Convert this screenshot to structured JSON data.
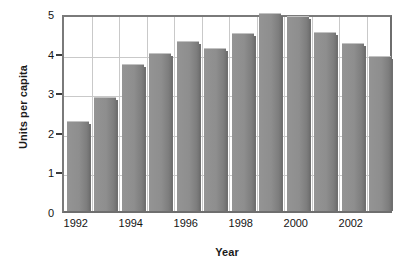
{
  "chart_data": {
    "type": "bar",
    "title": "",
    "xlabel": "Year",
    "ylabel": "Units per capita",
    "categories": [
      "1992",
      "1993",
      "1994",
      "1995",
      "1996",
      "1997",
      "1998",
      "1999",
      "2000",
      "2001",
      "2002",
      "2003"
    ],
    "values": [
      2.27,
      2.88,
      3.71,
      4.0,
      4.29,
      4.11,
      4.49,
      5.0,
      4.92,
      4.52,
      4.24,
      3.92
    ],
    "xtick_labels": [
      "1992",
      "1994",
      "1996",
      "1998",
      "2000",
      "2002"
    ],
    "xtick_categories": [
      "1992",
      "1994",
      "1996",
      "1998",
      "2000",
      "2002"
    ],
    "ytick_labels": [
      "0",
      "1",
      "2",
      "3",
      "4",
      "5"
    ],
    "ytick_values": [
      0,
      1,
      2,
      3,
      4,
      5
    ],
    "ylim": [
      0,
      5
    ],
    "grid": true,
    "legend": null,
    "bar_color": "#8e8e8e",
    "grid_color": "#c9c9c9",
    "frame_color": "#6e6e6e",
    "text_color": "#141414"
  }
}
